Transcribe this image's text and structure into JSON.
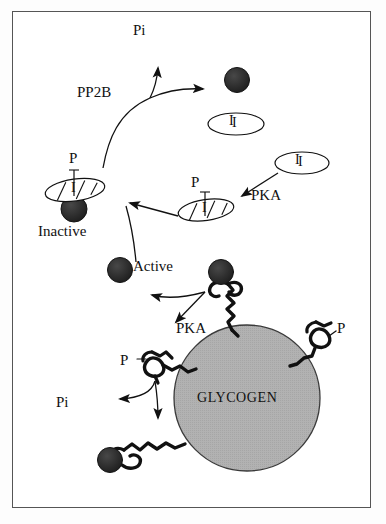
{
  "figure": {
    "border_color": "#555555",
    "background": "#ffffff"
  },
  "palette": {
    "sphere_fill": "#2b2b2b",
    "glycogen_fill": "#b2b2b2",
    "glycogen_stroke": "#2a2a2a",
    "chain_stroke": "#111111",
    "arrow_stroke": "#111111",
    "text": "#111111"
  },
  "labels": {
    "pi_top": "Pi",
    "pp2b": "PP2B",
    "p_left": "P",
    "inactive": "Inactive",
    "p_mid": "P",
    "pka_top": "PKA",
    "i_upper": "I",
    "i_right": "I",
    "active": "Active",
    "pka_bottom": "PKA",
    "p_bottom_left": "P",
    "p_right": "P",
    "pi_bottom": "Pi",
    "glycogen": "GLYCOGEN"
  },
  "nodes": {
    "inactive_complex": {
      "label": "Inactive",
      "phospho_label": "P",
      "inhibitor_label": "I",
      "sphere_cx": 74,
      "sphere_cy": 208,
      "sphere_r": 13,
      "ellipse_cx": 75,
      "ellipse_cy": 189,
      "ellipse_rx": 30,
      "ellipse_ry": 11,
      "ellipse_rotation": -8
    },
    "phospho_inhibitor": {
      "phospho_label": "P",
      "inhibitor_label": "I",
      "ellipse_cx": 206,
      "ellipse_cy": 210,
      "ellipse_rx": 28,
      "ellipse_ry": 10,
      "ellipse_rotation": -8
    },
    "free_sphere_top": {
      "cx": 237,
      "cy": 80,
      "r": 12
    },
    "inhibitor_upper": {
      "label": "I",
      "cx": 236,
      "cy": 124,
      "rx": 28,
      "ry": 11
    },
    "inhibitor_right": {
      "label": "I",
      "cx": 302,
      "cy": 163,
      "rx": 27,
      "ry": 11
    },
    "active_sphere": {
      "label": "Active",
      "cx": 120,
      "cy": 270,
      "r": 12
    },
    "glycogen_particle": {
      "label": "GLYCOGEN",
      "cx": 247,
      "cy": 398,
      "r": 73
    },
    "branch_top": {
      "sphere_cx": 221,
      "sphere_cy": 272,
      "sphere_r": 12
    },
    "branch_left": {
      "phospho_label": "P"
    },
    "branch_right": {
      "phospho_label": "P"
    },
    "branch_bottom": {
      "sphere_cx": 110,
      "sphere_cy": 460,
      "sphere_r": 12
    }
  },
  "arrows": [
    {
      "name": "pp2b-dephosphorylation",
      "from": "inactive-complex",
      "to": "free-sphere-and-pi",
      "label": "PP2B",
      "products": [
        "Pi"
      ]
    },
    {
      "name": "pka-phosphorylation-inhibitor",
      "from": "inhibitor-right",
      "to": "phospho-inhibitor",
      "label": "PKA"
    },
    {
      "name": "inhibitor-binding-to-inactive",
      "from": "phospho-inhibitor",
      "to": "inactive-complex",
      "label": ""
    },
    {
      "name": "pka-release-active",
      "from": "glycogen-branch-top",
      "to": "active-sphere",
      "label": "PKA"
    },
    {
      "name": "dephosphorylation-branch",
      "from": "glycogen-branch-left",
      "to": "branch-bottom",
      "label": "",
      "products": [
        "Pi"
      ]
    }
  ]
}
